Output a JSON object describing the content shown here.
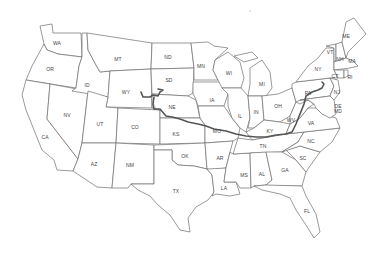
{
  "map": {
    "title": "United States state outline map with route",
    "background": "#ffffff",
    "border_color": "#6e6e6e",
    "route_color": "#555555",
    "states": [
      {
        "abbr": "WA",
        "x": 57,
        "y": 43
      },
      {
        "abbr": "OR",
        "x": 50,
        "y": 69
      },
      {
        "abbr": "CA",
        "x": 45,
        "y": 137
      },
      {
        "abbr": "NV",
        "x": 67,
        "y": 115
      },
      {
        "abbr": "ID",
        "x": 87,
        "y": 85
      },
      {
        "abbr": "MT",
        "x": 118,
        "y": 59
      },
      {
        "abbr": "WY",
        "x": 126,
        "y": 92
      },
      {
        "abbr": "UT",
        "x": 100,
        "y": 124
      },
      {
        "abbr": "CO",
        "x": 135,
        "y": 127
      },
      {
        "abbr": "AZ",
        "x": 94,
        "y": 164
      },
      {
        "abbr": "NM",
        "x": 130,
        "y": 165
      },
      {
        "abbr": "ND",
        "x": 168,
        "y": 57
      },
      {
        "abbr": "SD",
        "x": 169,
        "y": 80
      },
      {
        "abbr": "NE",
        "x": 172,
        "y": 107
      },
      {
        "abbr": "KS",
        "x": 176,
        "y": 134
      },
      {
        "abbr": "OK",
        "x": 185,
        "y": 156
      },
      {
        "abbr": "TX",
        "x": 176,
        "y": 191
      },
      {
        "abbr": "MN",
        "x": 201,
        "y": 66
      },
      {
        "abbr": "IA",
        "x": 212,
        "y": 100
      },
      {
        "abbr": "MO",
        "x": 217,
        "y": 131
      },
      {
        "abbr": "AR",
        "x": 220,
        "y": 158
      },
      {
        "abbr": "LA",
        "x": 224,
        "y": 188
      },
      {
        "abbr": "WI",
        "x": 229,
        "y": 73
      },
      {
        "abbr": "IL",
        "x": 240,
        "y": 116
      },
      {
        "abbr": "MS",
        "x": 244,
        "y": 175
      },
      {
        "abbr": "MI",
        "x": 262,
        "y": 84
      },
      {
        "abbr": "IN",
        "x": 256,
        "y": 112
      },
      {
        "abbr": "TN",
        "x": 263,
        "y": 146
      },
      {
        "abbr": "AL",
        "x": 262,
        "y": 174
      },
      {
        "abbr": "OH",
        "x": 278,
        "y": 106
      },
      {
        "abbr": "KY",
        "x": 270,
        "y": 131
      },
      {
        "abbr": "GA",
        "x": 285,
        "y": 170
      },
      {
        "abbr": "FL",
        "x": 307,
        "y": 211
      },
      {
        "abbr": "WV",
        "x": 291,
        "y": 120
      },
      {
        "abbr": "VA",
        "x": 311,
        "y": 123
      },
      {
        "abbr": "NC",
        "x": 311,
        "y": 141
      },
      {
        "abbr": "SC",
        "x": 303,
        "y": 158
      },
      {
        "abbr": "PA",
        "x": 308,
        "y": 93
      },
      {
        "abbr": "NY",
        "x": 318,
        "y": 69
      },
      {
        "abbr": "NJ",
        "x": 337,
        "y": 92
      },
      {
        "abbr": "DE",
        "x": 338,
        "y": 106
      },
      {
        "abbr": "MD",
        "x": 338,
        "y": 111
      },
      {
        "abbr": "VT",
        "x": 330,
        "y": 52
      },
      {
        "abbr": "NH",
        "x": 340,
        "y": 59
      },
      {
        "abbr": "ME",
        "x": 346,
        "y": 36
      },
      {
        "abbr": "MA",
        "x": 352,
        "y": 61
      },
      {
        "abbr": "CT",
        "x": 335,
        "y": 76
      },
      {
        "abbr": "RI",
        "x": 350,
        "y": 77
      }
    ]
  }
}
